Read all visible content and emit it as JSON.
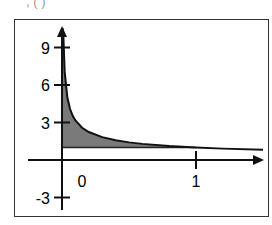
{
  "caption_fragment": ", ( ) ",
  "chart_data": {
    "type": "area",
    "title": "",
    "xlabel": "",
    "ylabel": "",
    "function": "y = 1/sqrt(x)",
    "shaded_region": "between curve and y = 1, from x = 0 to x = 1",
    "x_ticks": [
      0,
      1
    ],
    "y_ticks": [
      9,
      6,
      3,
      -3
    ],
    "xlim": [
      -0.15,
      1.5
    ],
    "ylim": [
      -3.5,
      10.5
    ],
    "grid": false,
    "legend": null,
    "x": [
      0.01,
      0.02,
      0.04,
      0.06,
      0.08,
      0.1,
      0.15,
      0.2,
      0.3,
      0.4,
      0.5,
      0.6,
      0.8,
      1.0,
      1.2,
      1.5
    ],
    "values": [
      10,
      7.07,
      5,
      4.08,
      3.54,
      3.16,
      2.58,
      2.24,
      1.83,
      1.58,
      1.41,
      1.29,
      1.12,
      1.0,
      0.91,
      0.82
    ],
    "colors": {
      "fill": "#7a7a7a",
      "line": "#111111",
      "frame": "#333333"
    }
  }
}
